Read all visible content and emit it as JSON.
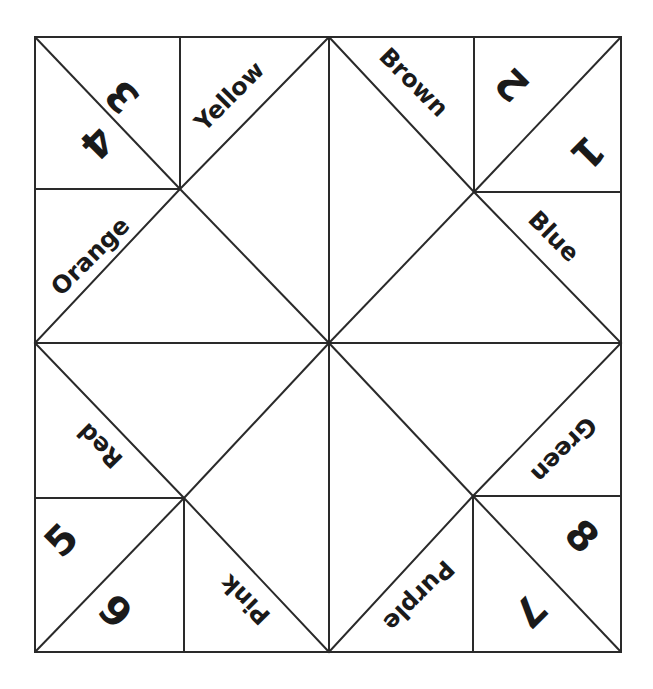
{
  "colors": {
    "line": "#2a2a2a",
    "text": "#1a1a1a",
    "background": "#ffffff"
  },
  "colors_words": {
    "yellow": "Yellow",
    "brown": "Brown",
    "orange": "Orange",
    "blue": "Blue",
    "red": "Red",
    "green": "Green",
    "pink": "Pink",
    "purple": "Purple"
  },
  "numbers": {
    "n1": "1",
    "n2": "2",
    "n3": "3",
    "n4": "4",
    "n5": "5",
    "n6": "6",
    "n7": "7",
    "n8": "8"
  }
}
